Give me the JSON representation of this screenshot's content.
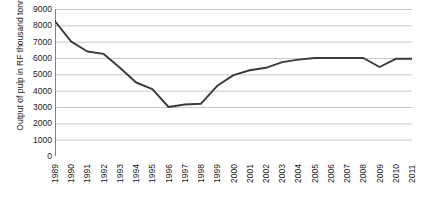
{
  "chart_data": {
    "type": "line",
    "title": "",
    "subtitle": "",
    "xlabel": "",
    "ylabel": "Output of pulp in RF thousand tonnes",
    "ylim": [
      0,
      9000
    ],
    "ytick_labels": [
      "9000",
      "8000",
      "7000",
      "6000",
      "5000",
      "4000",
      "3000",
      "2000",
      "1000",
      "0"
    ],
    "ytick_values": [
      9000,
      8000,
      7000,
      6000,
      5000,
      4000,
      3000,
      2000,
      1000,
      0
    ],
    "grid": "horizontal",
    "legend": "none",
    "categories": [
      "1989",
      "1990",
      "1991",
      "1992",
      "1993",
      "1994",
      "1995",
      "1996",
      "1997",
      "1998",
      "1999",
      "2000",
      "2001",
      "2002",
      "2003",
      "2004",
      "2005",
      "2006",
      "2007",
      "2008",
      "2009",
      "2010",
      "2011"
    ],
    "x": [
      1989,
      1990,
      1991,
      1992,
      1993,
      1994,
      1995,
      1996,
      1997,
      1998,
      1999,
      2000,
      2001,
      2002,
      2003,
      2004,
      2005,
      2006,
      2007,
      2008,
      2009,
      2010,
      2011
    ],
    "values": [
      8250,
      7000,
      6400,
      6250,
      5400,
      4500,
      4100,
      3000,
      3150,
      3200,
      4300,
      4950,
      5250,
      5400,
      5750,
      5900,
      6000,
      6000,
      6000,
      6000,
      5450,
      5950,
      5950
    ],
    "series": [
      {
        "name": "Output of pulp in RF thousand tonnes",
        "values": [
          8250,
          7000,
          6400,
          6250,
          5400,
          4500,
          4100,
          3000,
          3150,
          3200,
          4300,
          4950,
          5250,
          5400,
          5750,
          5900,
          6000,
          6000,
          6000,
          6000,
          5450,
          5950,
          5950
        ]
      }
    ],
    "colors": {
      "line": "#3a3a3a",
      "grid": "#c8c8c8",
      "axis": "#808080",
      "background": "#ffffff",
      "text": "#1a1a1a"
    }
  }
}
